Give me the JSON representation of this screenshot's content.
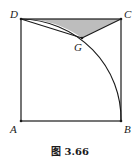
{
  "figure": {
    "caption": "图 3.66",
    "points": {
      "A": {
        "label": "A",
        "x": 21,
        "y": 121
      },
      "B": {
        "label": "B",
        "x": 121,
        "y": 121
      },
      "C": {
        "label": "C",
        "x": 121,
        "y": 19
      },
      "D": {
        "label": "D",
        "x": 21,
        "y": 19
      },
      "G": {
        "label": "G",
        "x": 82,
        "y": 38
      }
    },
    "shaded_region": "region bounded by DC, CG and arc DG",
    "arc": "quarter arc centered at A from D to B",
    "colors": {
      "stroke": "#1a1a1a",
      "shade": "#bdbdbd",
      "background": "#ffffff"
    }
  }
}
